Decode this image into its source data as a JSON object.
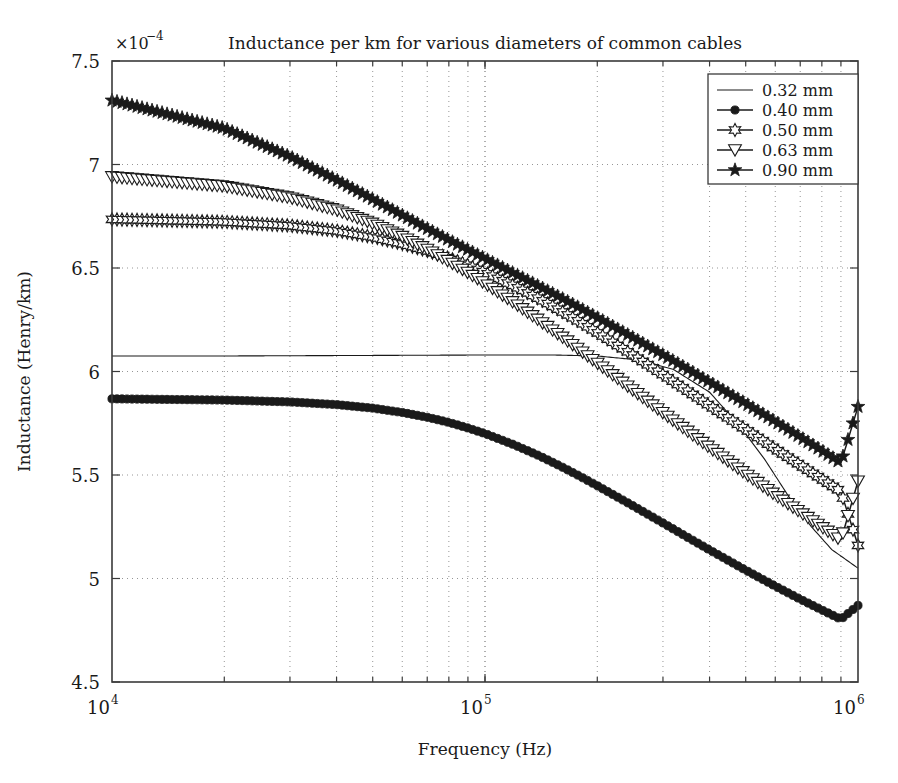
{
  "chart_data": {
    "type": "line",
    "title": "Inductance per km for various diameters of common cables",
    "xlabel": "Frequency (Hz)",
    "ylabel": "Inductance (Henry/km)",
    "xscale": "log",
    "yscale": "linear",
    "xlim": [
      10000,
      1000000
    ],
    "ylim": [
      4.5,
      7.5
    ],
    "y_offset_label": "×10",
    "y_offset_exponent": "−4",
    "y_ticks": [
      "4.5",
      "5",
      "5.5",
      "6",
      "6.5",
      "7",
      "7.5"
    ],
    "y_tick_values": [
      4.5,
      5,
      5.5,
      6,
      6.5,
      7,
      7.5
    ],
    "x_ticks": [
      "10",
      "10",
      "10"
    ],
    "x_tick_exponents": [
      "4",
      "5",
      "6"
    ],
    "x_tick_values": [
      10000,
      100000,
      1000000
    ],
    "grid": true,
    "legend_position": "top-right",
    "series": [
      {
        "name": "0.32 mm",
        "marker": "none",
        "x": [
          10000,
          14000,
          20000,
          28000,
          40000,
          56000,
          80000,
          110000,
          150000,
          200000,
          260000,
          320000,
          400000,
          480000,
          560000,
          650000,
          750000,
          850000,
          1000000
        ],
        "values": [
          6.075,
          6.075,
          6.075,
          6.076,
          6.077,
          6.078,
          6.079,
          6.08,
          6.08,
          6.075,
          6.055,
          6.01,
          5.9,
          5.74,
          5.58,
          5.4,
          5.25,
          5.14,
          5.05
        ]
      },
      {
        "name": "0.40 mm",
        "marker": "circle-filled",
        "x": [
          10000,
          20000,
          30000,
          40000,
          50000,
          60000,
          70000,
          80000,
          90000,
          100000,
          120000,
          140000,
          160000,
          180000,
          200000,
          250000,
          300000,
          350000,
          400000,
          500000,
          600000,
          700000,
          800000,
          900000,
          1000000
        ],
        "values": [
          5.868,
          5.862,
          5.853,
          5.84,
          5.823,
          5.802,
          5.779,
          5.754,
          5.727,
          5.7,
          5.645,
          5.592,
          5.541,
          5.493,
          5.448,
          5.35,
          5.268,
          5.198,
          5.138,
          5.04,
          4.963,
          4.9,
          4.848,
          4.803,
          4.87
        ]
      },
      {
        "name": "0.50 mm",
        "marker": "hexagram",
        "x": [
          10000,
          20000,
          30000,
          40000,
          50000,
          60000,
          70000,
          80000,
          90000,
          100000,
          120000,
          140000,
          160000,
          180000,
          200000,
          250000,
          300000,
          350000,
          400000,
          500000,
          600000,
          700000,
          800000,
          900000,
          1000000
        ],
        "values": [
          6.735,
          6.723,
          6.705,
          6.68,
          6.65,
          6.617,
          6.583,
          6.548,
          6.513,
          6.478,
          6.412,
          6.35,
          6.292,
          6.238,
          6.188,
          6.078,
          5.985,
          5.905,
          5.835,
          5.72,
          5.626,
          5.548,
          5.48,
          5.42,
          5.16
        ]
      },
      {
        "name": "0.63 mm",
        "marker": "triangle-down",
        "x": [
          10000,
          20000,
          30000,
          40000,
          50000,
          60000,
          70000,
          80000,
          90000,
          100000,
          120000,
          140000,
          160000,
          180000,
          200000,
          250000,
          300000,
          350000,
          400000,
          500000,
          600000,
          700000,
          800000,
          900000,
          1000000
        ],
        "values": [
          6.94,
          6.895,
          6.84,
          6.78,
          6.715,
          6.652,
          6.59,
          6.532,
          6.477,
          6.425,
          6.33,
          6.245,
          6.17,
          6.102,
          6.04,
          5.908,
          5.8,
          5.71,
          5.632,
          5.505,
          5.403,
          5.32,
          5.248,
          5.185,
          5.47
        ]
      },
      {
        "name": "0.90 mm",
        "marker": "star",
        "x": [
          10000,
          20000,
          30000,
          40000,
          50000,
          60000,
          70000,
          80000,
          90000,
          100000,
          120000,
          140000,
          160000,
          180000,
          200000,
          250000,
          300000,
          350000,
          400000,
          500000,
          600000,
          700000,
          800000,
          900000,
          1000000
        ],
        "values": [
          7.31,
          7.175,
          7.038,
          6.925,
          6.832,
          6.755,
          6.69,
          6.635,
          6.588,
          6.545,
          6.472,
          6.41,
          6.355,
          6.305,
          6.26,
          6.162,
          6.08,
          6.01,
          5.948,
          5.845,
          5.758,
          5.683,
          5.617,
          5.558,
          5.83
        ]
      }
    ]
  },
  "legend": {
    "entries": [
      {
        "label": "0.32 mm",
        "marker": "none"
      },
      {
        "label": "0.40 mm",
        "marker": "circle-filled"
      },
      {
        "label": "0.50 mm",
        "marker": "hexagram"
      },
      {
        "label": "0.63 mm",
        "marker": "triangle-down"
      },
      {
        "label": "0.90 mm",
        "marker": "star"
      }
    ]
  },
  "colors": {
    "line": "#1a1a1a",
    "axis": "#3a3a3a",
    "grid": "#8a8a8a",
    "background": "#ffffff"
  }
}
